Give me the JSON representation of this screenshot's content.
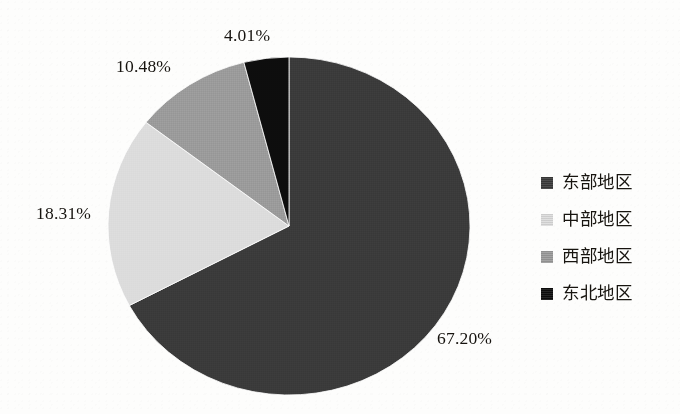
{
  "chart_data": {
    "type": "pie",
    "title": "",
    "subtitle": "",
    "xlabel": "",
    "ylabel": "",
    "legend_position": "right",
    "grid": false,
    "start_angle_deg": 0,
    "direction": "clockwise",
    "categories": [
      "东部地区",
      "中部地区",
      "西部地区",
      "东北地区"
    ],
    "values": [
      67.2,
      18.31,
      10.48,
      4.01
    ],
    "value_unit": "%",
    "data_labels": [
      "67.20%",
      "18.31%",
      "10.48%",
      "4.01%"
    ],
    "colors": [
      "#3a3a3a",
      "#dcdcdc",
      "#9a9a9a",
      "#0d0d0d"
    ],
    "slices": [
      {
        "label": "东部地区",
        "value": 67.2,
        "display": "67.20%",
        "color": "#3a3a3a"
      },
      {
        "label": "中部地区",
        "value": 18.31,
        "display": "18.31%",
        "color": "#dcdcdc"
      },
      {
        "label": "西部地区",
        "value": 10.48,
        "display": "10.48%",
        "color": "#9a9a9a"
      },
      {
        "label": "东北地区",
        "value": 4.01,
        "display": "4.01%",
        "color": "#0d0d0d"
      }
    ]
  },
  "labels": {
    "east": "67.20%",
    "central": "18.31%",
    "west": "10.48%",
    "northeast": "4.01%"
  },
  "legend": {
    "items": [
      {
        "label": "东部地区",
        "color": "#3a3a3a"
      },
      {
        "label": "中部地区",
        "color": "#dcdcdc"
      },
      {
        "label": "西部地区",
        "color": "#9a9a9a"
      },
      {
        "label": "东北地区",
        "color": "#0d0d0d"
      }
    ]
  }
}
